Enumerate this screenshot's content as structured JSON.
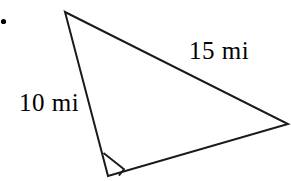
{
  "figure": {
    "kind": "right-triangle-diagram",
    "background_color": "#ffffff",
    "stroke_color": "#1a1a1a",
    "stroke_width": 2,
    "bullet": {
      "name": "list-bullet",
      "x": 3,
      "y": 21,
      "size": 4,
      "color": "#000000"
    },
    "vertices": {
      "apex": {
        "x": 65,
        "y": 12
      },
      "right_angle": {
        "x": 108,
        "y": 176
      },
      "far_right": {
        "x": 288,
        "y": 124
      }
    },
    "edges": [
      {
        "name": "leg-left",
        "from": "apex",
        "to": "right_angle",
        "label": "10 mi"
      },
      {
        "name": "hypotenuse",
        "from": "apex",
        "to": "far_right",
        "label": "15 mi"
      },
      {
        "name": "leg-bottom",
        "from": "right_angle",
        "to": "far_right",
        "label": ""
      }
    ],
    "right_angle_marker": {
      "name": "right-angle-square",
      "points": "104,153 123,170 109,175 ",
      "size": 21
    },
    "labels": {
      "hypotenuse": "15 mi",
      "leg": "10 mi"
    },
    "units": "mi"
  }
}
